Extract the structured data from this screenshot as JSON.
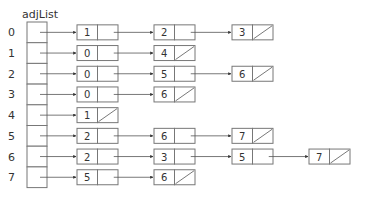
{
  "title": "adjList",
  "rows": [
    {
      "index": "0",
      "list": [
        "1",
        "2",
        "3"
      ]
    },
    {
      "index": "1",
      "list": [
        "0",
        "4"
      ]
    },
    {
      "index": "2",
      "list": [
        "0",
        "5",
        "6"
      ]
    },
    {
      "index": "3",
      "list": [
        "0",
        "6"
      ]
    },
    {
      "index": "4",
      "list": [
        "1"
      ]
    },
    {
      "index": "5",
      "list": [
        "2",
        "6",
        "7"
      ]
    },
    {
      "index": "6",
      "list": [
        "2",
        "3",
        "5",
        "7"
      ]
    },
    {
      "index": "7",
      "list": [
        "5",
        "6"
      ]
    }
  ]
}
